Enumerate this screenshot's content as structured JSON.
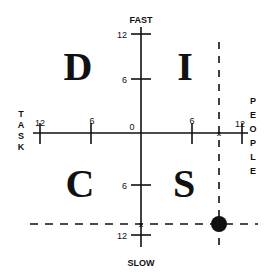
{
  "diagram": {
    "type": "DISC quadrant chart",
    "axes": {
      "vertical": {
        "top_label": "FAST",
        "bottom_label": "SLOW"
      },
      "horizontal": {
        "left_label": "TASK",
        "right_label": "PEOPLE"
      }
    },
    "ticks": {
      "origin": "0",
      "top_12": "12",
      "top_6": "6",
      "bottom_6": "6",
      "bottom_12": "12",
      "left_12": "12",
      "left_6": "6",
      "right_6": "6",
      "right_12": "12"
    },
    "quadrants": {
      "top_left": "D",
      "top_right": "I",
      "bottom_left": "C",
      "bottom_right": "S"
    },
    "left_label_letters": [
      "T",
      "A",
      "S",
      "K"
    ],
    "right_label_letters": [
      "P",
      "E",
      "O",
      "P",
      "L",
      "E"
    ],
    "marker": {
      "x_value": 9,
      "y_value": -11,
      "description": "plotted point at intersection of dashed lines"
    },
    "colors": {
      "ink": "#111111",
      "background": "#ffffff"
    }
  }
}
